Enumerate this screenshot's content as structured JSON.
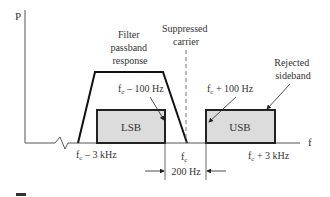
{
  "axes": {
    "y_label": "P",
    "x_label": "f"
  },
  "annotations": {
    "filter": [
      "Filter",
      "passband",
      "response"
    ],
    "carrier": [
      "Suppressed",
      "carrier"
    ],
    "rejected": [
      "Rejected",
      "sideband"
    ],
    "fc_minus_100": "f",
    "fc_minus_100_sub": "c",
    "fc_minus_100_rest": " – 100 Hz",
    "fc_plus_100": "f",
    "fc_plus_100_sub": "c",
    "fc_plus_100_rest": " + 100 Hz"
  },
  "bands": {
    "lsb": "LSB",
    "usb": "USB"
  },
  "ticks": {
    "fc_minus_3k": "f",
    "fc_minus_3k_sub": "c",
    "fc_minus_3k_rest": " – 3 kHz",
    "fc": "f",
    "fc_sub": "c",
    "fc_plus_3k": "f",
    "fc_plus_3k_sub": "c",
    "fc_plus_3k_rest": " + 3 kHz",
    "gap": "200 Hz"
  },
  "colors": {
    "band_fill": "#dcdcdc",
    "line": "#222222",
    "text": "#333333"
  }
}
